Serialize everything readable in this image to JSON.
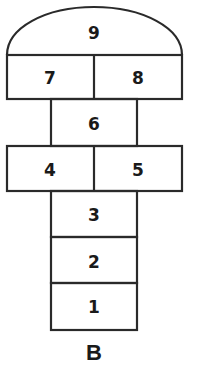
{
  "diagram": {
    "type": "hopscotch-grid",
    "caption": "B",
    "colors": {
      "line": "#2a2a2a",
      "text": "#1a1a1a",
      "background": "#ffffff"
    },
    "squares": [
      {
        "number": "9",
        "shape": "semicircle-dome",
        "row": 1
      },
      {
        "number": "7",
        "shape": "rect",
        "row": 2,
        "position": "left"
      },
      {
        "number": "8",
        "shape": "rect",
        "row": 2,
        "position": "right"
      },
      {
        "number": "6",
        "shape": "rect",
        "row": 3,
        "position": "center"
      },
      {
        "number": "4",
        "shape": "rect",
        "row": 4,
        "position": "left"
      },
      {
        "number": "5",
        "shape": "rect",
        "row": 4,
        "position": "right"
      },
      {
        "number": "3",
        "shape": "rect",
        "row": 5,
        "position": "center"
      },
      {
        "number": "2",
        "shape": "rect",
        "row": 6,
        "position": "center"
      },
      {
        "number": "1",
        "shape": "rect",
        "row": 7,
        "position": "center"
      }
    ],
    "labels": {
      "s9": "9",
      "s7": "7",
      "s8": "8",
      "s6": "6",
      "s4": "4",
      "s5": "5",
      "s3": "3",
      "s2": "2",
      "s1": "1"
    }
  }
}
